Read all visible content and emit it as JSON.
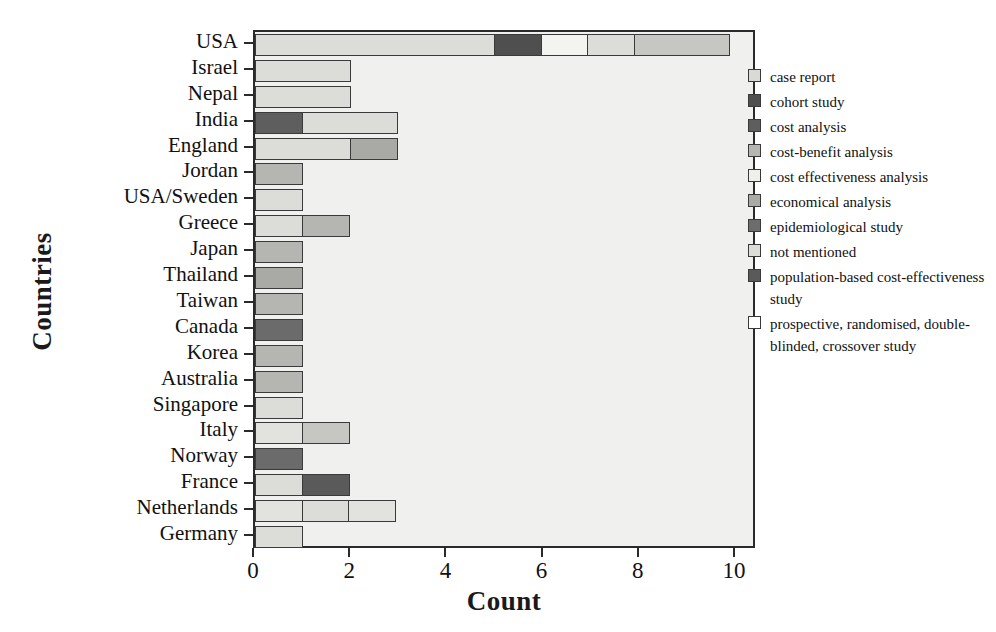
{
  "chart_data": {
    "type": "bar",
    "orientation": "horizontal",
    "stacked": true,
    "title": "",
    "xlabel": "Count",
    "ylabel": "Countries",
    "xlim": [
      0,
      10
    ],
    "xticks": [
      0,
      2,
      4,
      6,
      8,
      10
    ],
    "grid": false,
    "legend_position": "right",
    "categories": [
      "USA",
      "Israel",
      "Nepal",
      "India",
      "England",
      "Jordan",
      "USA/Sweden",
      "Greece",
      "Japan",
      "Thailand",
      "Taiwan",
      "Canada",
      "Korea",
      "Australia",
      "Singapore",
      "Italy",
      "Norway",
      "France",
      "Netherlands",
      "Germany"
    ],
    "series": [
      {
        "name": "case report",
        "color": "#d9d9d5",
        "values": [
          0,
          0,
          0,
          0,
          0,
          0,
          1,
          1,
          0,
          0,
          0,
          0,
          0,
          0,
          1,
          1,
          0,
          1,
          1,
          1
        ]
      },
      {
        "name": "cohort study",
        "color": "#4f4f4f",
        "values": [
          0,
          0,
          0,
          0,
          0,
          0,
          0,
          0,
          0,
          0,
          0,
          1,
          0,
          0,
          0,
          0,
          0,
          0,
          0,
          0
        ]
      },
      {
        "name": "cost analysis",
        "color": "#5e5e5e",
        "values": [
          0,
          0,
          0,
          1,
          0,
          0,
          0,
          0,
          0,
          0,
          0,
          0,
          0,
          0,
          0,
          0,
          1,
          0,
          0,
          0
        ]
      },
      {
        "name": "cost-benefit analysis",
        "color": "#b5b5b1",
        "values": [
          0,
          0,
          0,
          0,
          1,
          1,
          0,
          1,
          1,
          0,
          1,
          0,
          1,
          1,
          0,
          1,
          0,
          0,
          1,
          0
        ]
      },
      {
        "name": "cost effectiveness analysis",
        "color": "#efefec",
        "values": [
          1,
          0,
          0,
          0,
          0,
          0,
          0,
          0,
          0,
          0,
          0,
          0,
          0,
          0,
          0,
          0,
          0,
          0,
          0,
          0
        ]
      },
      {
        "name": "economical analysis",
        "color": "#a9a9a5",
        "values": [
          1,
          0,
          0,
          0,
          0,
          0,
          0,
          0,
          0,
          1,
          0,
          0,
          0,
          0,
          0,
          0,
          0,
          0,
          0,
          0
        ]
      },
      {
        "name": "epidemiological study",
        "color": "#6d6d6d",
        "values": [
          0,
          0,
          0,
          0,
          0,
          0,
          0,
          0,
          0,
          0,
          0,
          0,
          0,
          0,
          0,
          0,
          0,
          1,
          0,
          0
        ]
      },
      {
        "name": "not mentioned",
        "color": "#dcdcd8",
        "values": [
          5,
          2,
          2,
          2,
          2,
          0,
          0,
          0,
          0,
          0,
          0,
          0,
          0,
          0,
          0,
          0,
          0,
          0,
          1,
          0
        ]
      },
      {
        "name": "population-based cost-effectiveness study",
        "color": "#5a5a5a",
        "values": [
          0,
          0,
          0,
          0,
          0,
          0,
          0,
          0,
          0,
          0,
          0,
          0,
          0,
          0,
          0,
          0,
          0,
          0,
          0,
          0
        ]
      },
      {
        "name": "prospective, randomised, double-blinded, crossover study",
        "color": "#ffffff",
        "values": [
          1,
          0,
          0,
          0,
          0,
          0,
          0,
          0,
          0,
          0,
          0,
          0,
          0,
          0,
          0,
          0,
          0,
          0,
          0,
          0
        ]
      }
    ],
    "bars": [
      {
        "category": "USA",
        "segments": [
          {
            "series": "not mentioned",
            "value": 5,
            "color": "#dcdcd8"
          },
          {
            "series": "cohort study",
            "value": 1,
            "color": "#4f4f4f"
          },
          {
            "series": "cost effectiveness analysis",
            "value": 1,
            "color": "#f3f3f0"
          },
          {
            "series": "case report",
            "value": 1,
            "color": "#dcdcd8"
          },
          {
            "series": "economical analysis",
            "value": 2,
            "color": "#c6c6c2"
          }
        ]
      },
      {
        "category": "Israel",
        "segments": [
          {
            "series": "not mentioned",
            "value": 2,
            "color": "#dcdcd8"
          }
        ]
      },
      {
        "category": "Nepal",
        "segments": [
          {
            "series": "not mentioned",
            "value": 2,
            "color": "#dcdcd8"
          }
        ]
      },
      {
        "category": "India",
        "segments": [
          {
            "series": "cost analysis",
            "value": 1,
            "color": "#5e5e5e"
          },
          {
            "series": "not mentioned",
            "value": 2,
            "color": "#dcdcd8"
          }
        ]
      },
      {
        "category": "England",
        "segments": [
          {
            "series": "not mentioned",
            "value": 2,
            "color": "#dcdcd8"
          },
          {
            "series": "cost-benefit analysis",
            "value": 1,
            "color": "#a9a9a5"
          }
        ]
      },
      {
        "category": "Jordan",
        "segments": [
          {
            "series": "cost-benefit analysis",
            "value": 1,
            "color": "#b5b5b1"
          }
        ]
      },
      {
        "category": "USA/Sweden",
        "segments": [
          {
            "series": "case report",
            "value": 1,
            "color": "#dcdcd8"
          }
        ]
      },
      {
        "category": "Greece",
        "segments": [
          {
            "series": "case report",
            "value": 1,
            "color": "#dcdcd8"
          },
          {
            "series": "cost-benefit analysis",
            "value": 1,
            "color": "#b5b5b1"
          }
        ]
      },
      {
        "category": "Japan",
        "segments": [
          {
            "series": "cost-benefit analysis",
            "value": 1,
            "color": "#b5b5b1"
          }
        ]
      },
      {
        "category": "Thailand",
        "segments": [
          {
            "series": "economical analysis",
            "value": 1,
            "color": "#a9a9a5"
          }
        ]
      },
      {
        "category": "Taiwan",
        "segments": [
          {
            "series": "cost-benefit analysis",
            "value": 1,
            "color": "#b5b5b1"
          }
        ]
      },
      {
        "category": "Canada",
        "segments": [
          {
            "series": "cohort study",
            "value": 1,
            "color": "#6b6b6b"
          }
        ]
      },
      {
        "category": "Korea",
        "segments": [
          {
            "series": "cost-benefit analysis",
            "value": 1,
            "color": "#b5b5b1"
          }
        ]
      },
      {
        "category": "Australia",
        "segments": [
          {
            "series": "cost-benefit analysis",
            "value": 1,
            "color": "#b5b5b1"
          }
        ]
      },
      {
        "category": "Singapore",
        "segments": [
          {
            "series": "case report",
            "value": 1,
            "color": "#dcdcd8"
          }
        ]
      },
      {
        "category": "Italy",
        "segments": [
          {
            "series": "case report",
            "value": 1,
            "color": "#e2e2de"
          },
          {
            "series": "cost-benefit analysis",
            "value": 1,
            "color": "#c6c6c2"
          }
        ]
      },
      {
        "category": "Norway",
        "segments": [
          {
            "series": "cost analysis",
            "value": 1,
            "color": "#6b6b6b"
          }
        ]
      },
      {
        "category": "France",
        "segments": [
          {
            "series": "case report",
            "value": 1,
            "color": "#dcdcd8"
          },
          {
            "series": "epidemiological study",
            "value": 1,
            "color": "#5a5a5a"
          }
        ]
      },
      {
        "category": "Netherlands",
        "segments": [
          {
            "series": "case report",
            "value": 1,
            "color": "#e2e2de"
          },
          {
            "series": "cost-benefit analysis",
            "value": 1,
            "color": "#dcdcd8"
          },
          {
            "series": "not mentioned",
            "value": 1,
            "color": "#e2e2de"
          }
        ]
      },
      {
        "category": "Germany",
        "segments": [
          {
            "series": "case report",
            "value": 1,
            "color": "#dcdcd8"
          }
        ]
      }
    ],
    "legend": [
      {
        "label": "case report",
        "color": "#d9d9d5"
      },
      {
        "label": "cohort study",
        "color": "#4f4f4f"
      },
      {
        "label": "cost analysis",
        "color": "#5e5e5e"
      },
      {
        "label": "cost-benefit analysis",
        "color": "#b5b5b1"
      },
      {
        "label": "cost effectiveness analysis",
        "color": "#efefec"
      },
      {
        "label": "economical analysis",
        "color": "#a9a9a5"
      },
      {
        "label": "epidemiological study",
        "color": "#6d6d6d"
      },
      {
        "label": "not mentioned",
        "color": "#dcdcd8"
      },
      {
        "label": "population-based cost-effectiveness study",
        "color": "#5a5a5a"
      },
      {
        "label": "prospective, randomised, double-blinded, crossover study",
        "color": "#ffffff"
      }
    ]
  }
}
